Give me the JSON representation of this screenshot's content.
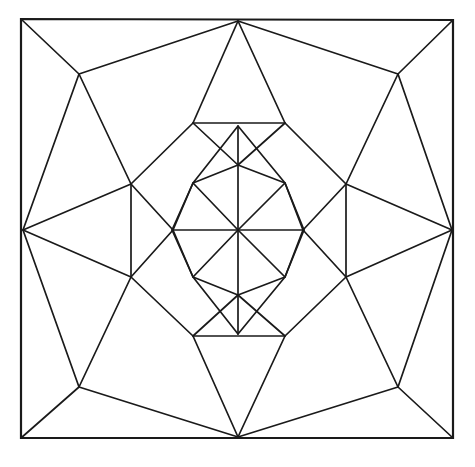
{
  "figure": {
    "canvas": {
      "width": 475,
      "height": 467
    },
    "background_color": "#ffffff",
    "line_color": "#1a1a1a",
    "fill_color": "#ffffff",
    "stroke_width": 1.7,
    "frame_stroke_width": 2.2,
    "symmetry": "8-fold dihedral",
    "center": {
      "x": 238,
      "y": 230
    }
  },
  "chart_data": {
    "type": "line",
    "subtitle": "",
    "xlabel": "",
    "ylabel": "",
    "grid": false,
    "legend": "none",
    "xlim": [
      0,
      475
    ],
    "ylim": [
      0,
      467
    ],
    "vertices": {
      "center": {
        "x": 238,
        "y": 230
      },
      "frame_tl": {
        "x": 21,
        "y": 19
      },
      "frame_tr": {
        "x": 453,
        "y": 20
      },
      "frame_br": {
        "x": 453,
        "y": 438
      },
      "frame_bl": {
        "x": 21,
        "y": 438
      },
      "edge_top": {
        "x": 238,
        "y": 21
      },
      "edge_right": {
        "x": 452,
        "y": 230
      },
      "edge_bottom": {
        "x": 238,
        "y": 437
      },
      "edge_left": {
        "x": 23,
        "y": 230
      },
      "oct_tl": {
        "x": 79,
        "y": 74
      },
      "oct_tr": {
        "x": 398,
        "y": 74
      },
      "oct_br": {
        "x": 398,
        "y": 387
      },
      "oct_bl": {
        "x": 79,
        "y": 387
      },
      "ring_n_left": {
        "x": 193,
        "y": 123
      },
      "ring_n_right": {
        "x": 285,
        "y": 123
      },
      "ring_e_top": {
        "x": 346,
        "y": 184
      },
      "ring_e_bottom": {
        "x": 346,
        "y": 277
      },
      "ring_s_right": {
        "x": 285,
        "y": 336
      },
      "ring_s_left": {
        "x": 193,
        "y": 336
      },
      "ring_w_bottom": {
        "x": 131,
        "y": 277
      },
      "ring_w_top": {
        "x": 131,
        "y": 184
      },
      "star_tip_n": {
        "x": 238,
        "y": 126
      },
      "star_tip_ne": {
        "x": 285,
        "y": 183
      },
      "star_tip_e": {
        "x": 172,
        "y": 230
      },
      "star_tip_se": {
        "x": 285,
        "y": 277
      },
      "star_tip_s": {
        "x": 238,
        "y": 334
      },
      "star_tip_sw": {
        "x": 193,
        "y": 277
      },
      "star_tip_w": {
        "x": 304,
        "y": 230
      },
      "star_tip_nw": {
        "x": 193,
        "y": 183
      },
      "notch_nw": {
        "x": 193,
        "y": 183
      },
      "notch_ne": {
        "x": 285,
        "y": 183
      },
      "notch_se": {
        "x": 285,
        "y": 277
      },
      "notch_sw": {
        "x": 193,
        "y": 277
      },
      "arm_n": {
        "x": 238,
        "y": 165
      },
      "arm_e": {
        "x": 303,
        "y": 230
      },
      "arm_s": {
        "x": 238,
        "y": 295
      },
      "arm_w": {
        "x": 173,
        "y": 230
      }
    },
    "star_points": 8,
    "ring_count": 3,
    "region_count": 32
  },
  "geometry": {
    "frame": "21,19 453,20 453,438 21,438",
    "spokes": [
      "238,230 238,126",
      "238,230 285,183",
      "238,230 304,230",
      "238,230 285,277",
      "238,230 238,334",
      "238,230 193,277",
      "238,230 172,230",
      "238,230 193,183"
    ],
    "star_outline": "238,126 285,183 304,230 285,277 238,334 193,277 172,230 193,183",
    "ring_inner": "193,183 238,165 285,183 303,230 285,277 238,295 193,277 173,230",
    "ring_mid": "193,123 285,123 346,184 346,277 285,336 193,336 131,277 131,184",
    "octagon_outer": "238,21 398,74 452,230 398,387 238,437 79,387 23,230 79,74",
    "corner_diagonals": [
      "21,19 79,74",
      "453,20 398,74",
      "453,438 398,387",
      "21,438 79,387"
    ],
    "ring_connectors": [
      "193,123 238,165",
      "285,123 238,165",
      "346,184 303,230",
      "346,277 303,230",
      "285,336 238,295",
      "193,336 238,295",
      "131,277 173,230",
      "131,184 173,230"
    ],
    "outer_to_mid": [
      "238,21 193,123",
      "238,21 285,123",
      "398,74 346,184",
      "452,230 346,184",
      "452,230 346,277",
      "398,387 346,277",
      "238,437 285,336",
      "238,437 193,336",
      "79,387 131,277",
      "23,230 131,277",
      "23,230 131,184",
      "79,74 131,184"
    ],
    "octagon_spokes": [
      "79,74 238,21",
      "238,21 398,74",
      "398,74 452,230",
      "452,230 398,387",
      "398,387 238,437",
      "238,437 79,387",
      "79,387 23,230",
      "23,230 79,74"
    ]
  }
}
